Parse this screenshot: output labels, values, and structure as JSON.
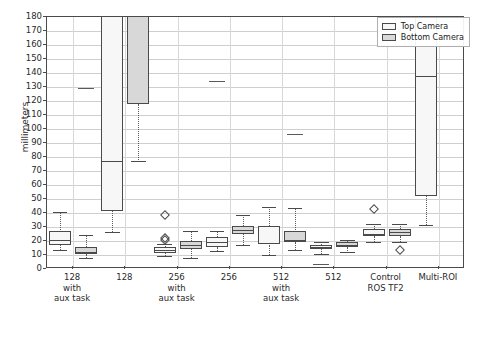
{
  "chart_data": {
    "type": "box",
    "title": "",
    "xlabel": "",
    "ylabel": "millimeters",
    "ylim": [
      0,
      180
    ],
    "ytick_values": [
      0,
      10,
      20,
      30,
      40,
      50,
      60,
      70,
      80,
      90,
      100,
      110,
      120,
      130,
      140,
      150,
      160,
      170,
      180
    ],
    "ytick_labels": [
      "0",
      "10",
      "20",
      "30",
      "40",
      "50",
      "60",
      "70",
      "80",
      "90",
      "100",
      "110",
      "120",
      "130",
      "140",
      "150",
      "160",
      "170",
      "180"
    ],
    "grid": true,
    "legend_position": "upper right",
    "legend": [
      {
        "name": "Top Camera",
        "color": "#f7f7f7"
      },
      {
        "name": "Bottom Camera",
        "color": "#d8d8d8"
      }
    ],
    "categories": [
      "128\nwith\naux task",
      "128",
      "256\nwith\naux task",
      "256",
      "512\nwith\naux task",
      "512",
      "Control\nROS TF2",
      "Multi-ROI"
    ],
    "series": [
      {
        "name": "Top Camera",
        "boxes": [
          {
            "whisker_low": 13.5,
            "q1": 17.0,
            "median": 21.0,
            "q3": 27.5,
            "whisker_high": 41.0,
            "fliers": []
          },
          {
            "whisker_low": 26.5,
            "q1": 41.5,
            "median": 77.5,
            "q3": 186.0,
            "whisker_high": 186.0,
            "fliers": []
          },
          {
            "whisker_low": 9.0,
            "q1": 11.5,
            "median": 13.5,
            "q3": 16.0,
            "whisker_high": 18.0,
            "fliers": [
              20.5,
              22.0,
              38.5
            ]
          },
          {
            "whisker_low": 13.0,
            "q1": 16.0,
            "median": 19.5,
            "q3": 23.0,
            "whisker_high": 27.0,
            "fliers": [
              134.0
            ]
          },
          {
            "whisker_low": 10.0,
            "q1": 17.5,
            "median": 18.5,
            "q3": 31.0,
            "whisker_high": 44.5,
            "fliers": []
          },
          {
            "whisker_low": 11.0,
            "q1": 14.0,
            "median": 15.5,
            "q3": 17.0,
            "whisker_high": 19.0,
            "fliers": [
              3.5
            ]
          },
          {
            "whisker_low": 19.0,
            "q1": 23.5,
            "median": 25.0,
            "q3": 28.5,
            "whisker_high": 32.0,
            "fliers": [
              43.0
            ]
          },
          {
            "whisker_low": 31.5,
            "q1": 52.5,
            "median": 138.0,
            "q3": 186.0,
            "whisker_high": 186.0,
            "fliers": []
          }
        ]
      },
      {
        "name": "Bottom Camera",
        "boxes": [
          {
            "whisker_low": 8.0,
            "q1": 10.5,
            "median": 12.0,
            "q3": 16.0,
            "whisker_high": 24.5,
            "fliers": [
              129.0
            ]
          },
          {
            "whisker_low": 77.5,
            "q1": 118.0,
            "median": 186.0,
            "q3": 186.0,
            "whisker_high": 186.0,
            "fliers": []
          },
          {
            "whisker_low": 8.0,
            "q1": 14.0,
            "median": 17.0,
            "q3": 20.0,
            "whisker_high": 27.0,
            "fliers": []
          },
          {
            "whisker_low": 17.5,
            "q1": 25.0,
            "median": 28.0,
            "q3": 30.5,
            "whisker_high": 38.5,
            "fliers": []
          },
          {
            "whisker_low": 13.5,
            "q1": 19.0,
            "median": 20.5,
            "q3": 27.5,
            "whisker_high": 43.5,
            "fliers": [
              96.5
            ]
          },
          {
            "whisker_low": 12.5,
            "q1": 15.5,
            "median": 17.5,
            "q3": 19.5,
            "whisker_high": 21.0,
            "fliers": []
          },
          {
            "whisker_low": 19.5,
            "q1": 23.5,
            "median": 26.5,
            "q3": 28.5,
            "whisker_high": 32.0,
            "fliers": [
              13.5
            ]
          },
          {
            "whisker_low": null,
            "q1": null,
            "median": null,
            "q3": null,
            "whisker_high": null,
            "fliers": []
          }
        ]
      }
    ]
  }
}
